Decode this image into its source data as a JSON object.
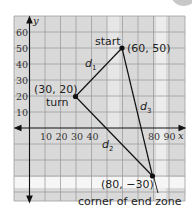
{
  "figure": {
    "axes": {
      "x_label": "x",
      "y_label": "y",
      "x_ticks": [
        "10",
        "20",
        "30",
        "40",
        "80",
        "90"
      ],
      "y_ticks": [
        "10",
        "20",
        "30",
        "40",
        "50",
        "60"
      ]
    },
    "points": [
      {
        "id": "start",
        "name": "start",
        "coord_label": "(60, 50)",
        "x": 60,
        "y": 50
      },
      {
        "id": "turn",
        "name": "turn",
        "coord_label": "(30, 20)",
        "x": 30,
        "y": 20
      },
      {
        "id": "corner",
        "name": "corner of end zone",
        "coord_label": "(80, −30)",
        "x": 80,
        "y": -30
      }
    ],
    "segments": [
      {
        "name": "d",
        "sub": "1",
        "from": "start",
        "to": "turn"
      },
      {
        "name": "d",
        "sub": "2",
        "from": "turn",
        "to": "corner"
      },
      {
        "name": "d",
        "sub": "3",
        "from": "start",
        "to": "corner"
      }
    ],
    "colors": {
      "grid_background": "#d9d9d9",
      "grid_line": "#9a9a9a",
      "highlight_band": "#f4f4f4",
      "line": "#111111"
    }
  }
}
